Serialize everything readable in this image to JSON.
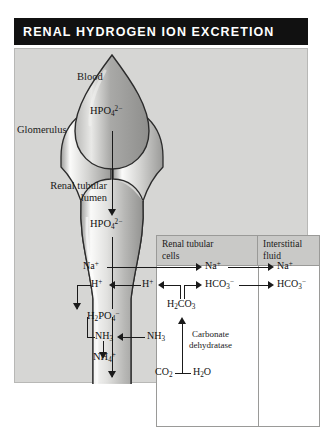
{
  "title": "RENAL HYDROGEN ION EXCRETION",
  "labels": {
    "blood": "Blood",
    "glomerulus": "Glomerulus",
    "lumen": "Renal tubular\nlumen"
  },
  "table": {
    "columns": [
      "Renal tubular\ncells",
      "Interstitial\nfluid"
    ]
  },
  "species": {
    "hpo4_top": "HPO4 2-",
    "hpo4_lumen": "HPO4 2-",
    "na_lumen": "Na+",
    "h_lumen": "H+",
    "h2po4": "H2PO4 -",
    "nh3_lumen": "NH3",
    "nh4": "NH4 +",
    "h_cell": "H+",
    "h2co3": "H2CO3",
    "hco3_cell": "HCO3 -",
    "na_cell": "Na+",
    "nh3_cell": "NH3",
    "co2": "CO2",
    "h2o": "H2O",
    "na_fluid": "Na+",
    "hco3_fluid": "HCO3 -"
  },
  "enzyme": "Carbonate\ndehydratase",
  "colors": {
    "title_bg": "#111111",
    "title_text": "#ffffff",
    "panel_bg": "#d6d6d4",
    "table_bg": "#ffffff",
    "header_bg": "#c9c9c7",
    "ink": "#1a1a1a"
  }
}
